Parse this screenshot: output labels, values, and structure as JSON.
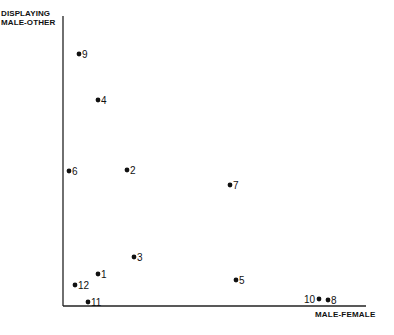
{
  "chart_data": {
    "type": "scatter",
    "title": "",
    "xlabel": "MALE-FEMALE",
    "ylabel": "DISPLAYING MALE-OTHER",
    "ylabel_lines": [
      "DISPLAYING",
      "MALE-OTHER"
    ],
    "grid": false,
    "legend": "none",
    "axis_ticks": "none",
    "points": [
      {
        "label": "1",
        "x": 35,
        "y": 32,
        "px": 98,
        "py": 274,
        "label_side": "right"
      },
      {
        "label": "2",
        "x": 64,
        "y": 136,
        "px": 127,
        "py": 170,
        "label_side": "right"
      },
      {
        "label": "3",
        "x": 71,
        "y": 49,
        "px": 134,
        "py": 257,
        "label_side": "right"
      },
      {
        "label": "4",
        "x": 35,
        "y": 206,
        "px": 98,
        "py": 100,
        "label_side": "right"
      },
      {
        "label": "5",
        "x": 173,
        "y": 26,
        "px": 236,
        "py": 280,
        "label_side": "right"
      },
      {
        "label": "6",
        "x": 6,
        "y": 135,
        "px": 69,
        "py": 171,
        "label_side": "right"
      },
      {
        "label": "7",
        "x": 167,
        "y": 121,
        "px": 230,
        "py": 185,
        "label_side": "right"
      },
      {
        "label": "8",
        "x": 265,
        "y": 6,
        "px": 328,
        "py": 300,
        "label_side": "right"
      },
      {
        "label": "9",
        "x": 16,
        "y": 252,
        "px": 79,
        "py": 54,
        "label_side": "right"
      },
      {
        "label": "10",
        "x": 256,
        "y": 7,
        "px": 319,
        "py": 299,
        "label_side": "left"
      },
      {
        "label": "11",
        "x": 25,
        "y": 4,
        "px": 88,
        "py": 302,
        "label_side": "right"
      },
      {
        "label": "12",
        "x": 12,
        "y": 21,
        "px": 75,
        "py": 285,
        "label_side": "right"
      }
    ],
    "axes": {
      "origin_px": [
        63,
        306
      ],
      "y_top_px": 16,
      "x_right_px": 366
    }
  }
}
